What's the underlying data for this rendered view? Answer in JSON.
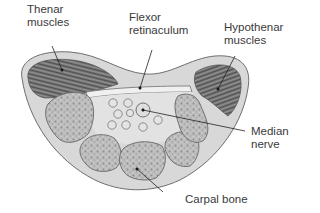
{
  "figure": {
    "labels": {
      "thenar": "Thenar\nmuscles",
      "flexor": "Flexor\nretinaculum",
      "hypothenar": "Hypothenar\nmuscles",
      "median": "Median\nnerve",
      "carpal": "Carpal bone"
    },
    "colors": {
      "outline": "#6e6e6e",
      "tissue_fill": "#d6d6d6",
      "muscle_fill": "#6a6a6a",
      "bone_fill": "#b9b9b9",
      "tunnel_fill": "#e2e2e2",
      "leader": "#222222",
      "text": "#3a3a3a"
    }
  }
}
